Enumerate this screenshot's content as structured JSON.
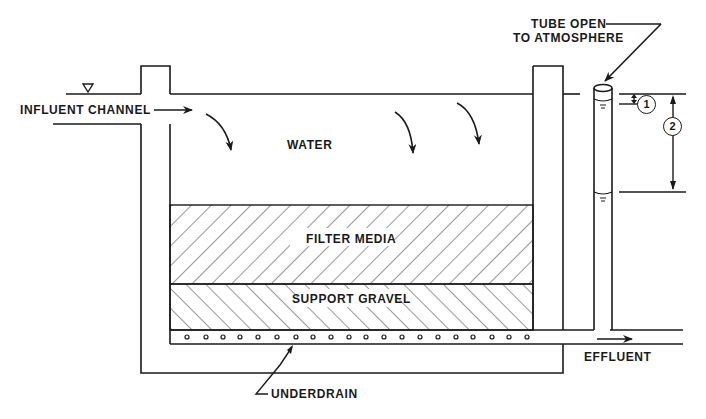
{
  "diagram": {
    "labels": {
      "influent": "INFLUENT CHANNEL",
      "water": "WATER",
      "filter_media": "FILTER MEDIA",
      "support_gravel": "SUPPORT GRAVEL",
      "underdrain": "UNDERDRAIN",
      "effluent": "EFFLUENT",
      "tube_line1": "TUBE OPEN",
      "tube_line2": "TO ATMOSPHERE"
    },
    "markers": {
      "one": "1",
      "two": "2"
    },
    "colors": {
      "line": "#1a1a1a",
      "background": "#ffffff"
    }
  }
}
